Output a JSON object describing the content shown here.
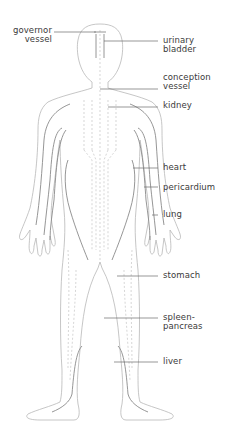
{
  "diagram": {
    "colors": {
      "body_outline": "#b8b8b8",
      "channel_line": "#8a8a8a",
      "channel_dashed": "#c4c4c4",
      "leader_line": "#6a6a6a",
      "label_text": "#3a3a3a",
      "background": "#ffffff"
    },
    "labels": {
      "governor_vessel": {
        "line1": "governor",
        "line2": "vessel"
      },
      "urinary_bladder": {
        "line1": "urinary",
        "line2": "bladder"
      },
      "conception_vessel": {
        "line1": "conception",
        "line2": "vessel"
      },
      "kidney": {
        "line1": "kidney"
      },
      "heart": {
        "line1": "heart"
      },
      "pericardium": {
        "line1": "pericardium"
      },
      "lung": {
        "line1": "lung"
      },
      "stomach": {
        "line1": "stomach"
      },
      "spleen_pancreas": {
        "line1": "spleen-",
        "line2": "pancreas"
      },
      "liver": {
        "line1": "liver"
      }
    }
  }
}
